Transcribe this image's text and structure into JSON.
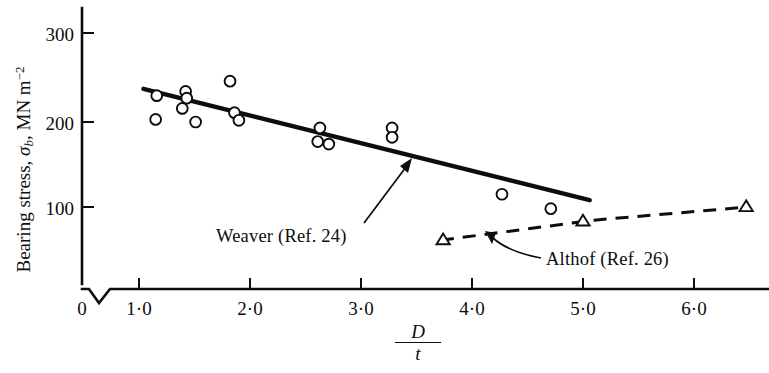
{
  "chart_data": {
    "type": "scatter",
    "title": "",
    "subtitle": "",
    "xlabel": "D/t",
    "xlabel_numerator": "D",
    "xlabel_denominator": "t",
    "ylabel": "Bearing stress, σb, MN m⁻²",
    "ylabel_prefix": "Bearing stress, ",
    "ylabel_symbol": "σ",
    "ylabel_symbol_sub": "b",
    "ylabel_unit": ", MN m",
    "ylabel_unit_sup": "−2",
    "xlim": [
      0.0,
      6.9
    ],
    "ylim": [
      0,
      330
    ],
    "x_axis_break": true,
    "x_axis_break_note": "zigzag break between 0 and 1.0",
    "grid": false,
    "legend": "none",
    "xticks": [
      {
        "value": 0,
        "label": "0"
      },
      {
        "value": 1.0,
        "label": "1·0"
      },
      {
        "value": 2.0,
        "label": "2·0"
      },
      {
        "value": 3.0,
        "label": "3·0"
      },
      {
        "value": 4.0,
        "label": "4·0"
      },
      {
        "value": 5.0,
        "label": "5·0"
      },
      {
        "value": 6.0,
        "label": "6·0"
      }
    ],
    "yticks": [
      {
        "value": 100,
        "label": "100"
      },
      {
        "value": 200,
        "label": "200"
      },
      {
        "value": 300,
        "label": "300"
      }
    ],
    "series": [
      {
        "name": "Weaver (Ref. 24) data",
        "marker": "open-circle",
        "points": [
          {
            "x": 1.16,
            "y": 231
          },
          {
            "x": 1.15,
            "y": 203
          },
          {
            "x": 1.42,
            "y": 236
          },
          {
            "x": 1.43,
            "y": 228
          },
          {
            "x": 1.39,
            "y": 216
          },
          {
            "x": 1.51,
            "y": 200
          },
          {
            "x": 1.82,
            "y": 248
          },
          {
            "x": 1.86,
            "y": 211
          },
          {
            "x": 1.9,
            "y": 202
          },
          {
            "x": 2.63,
            "y": 193
          },
          {
            "x": 2.61,
            "y": 177
          },
          {
            "x": 2.71,
            "y": 174
          },
          {
            "x": 3.28,
            "y": 193
          },
          {
            "x": 3.28,
            "y": 182
          },
          {
            "x": 4.27,
            "y": 115
          },
          {
            "x": 4.71,
            "y": 98
          }
        ]
      },
      {
        "name": "Althof (Ref. 26) data",
        "marker": "open-triangle",
        "points": [
          {
            "x": 3.74,
            "y": 61
          },
          {
            "x": 5.0,
            "y": 83
          },
          {
            "x": 6.47,
            "y": 100
          }
        ]
      }
    ],
    "trend_lines": [
      {
        "name": "Weaver (Ref. 24)",
        "style": "solid",
        "x_start": 1.04,
        "y_start": 239,
        "x_end": 5.06,
        "y_end": 108
      },
      {
        "name": "Althof (Ref. 26)",
        "style": "dashed",
        "x_start": 3.72,
        "y_start": 61,
        "x_end": 6.48,
        "y_end": 100
      }
    ],
    "annotations": [
      {
        "id": "weaver",
        "text": "Weaver  (Ref. 24)",
        "pointer": "arrow pointing up-right to solid trend line"
      },
      {
        "id": "althof",
        "text": "Althof (Ref. 26)",
        "pointer": "curved arrow pointing up-left to dashed trend line"
      }
    ]
  },
  "axis": {
    "y_title_prefix": "Bearing stress, ",
    "y_title_symbol": "σ",
    "y_title_sub": "b",
    "y_title_unit": ", MN m",
    "y_title_sup": "−2",
    "x_title_numerator": "D",
    "x_title_denominator": "t"
  },
  "ticks": {
    "y": [
      "300",
      "200",
      "100"
    ],
    "x": [
      "0",
      "1·0",
      "2·0",
      "3·0",
      "4·0",
      "5·0",
      "6·0"
    ]
  },
  "labels": {
    "weaver": "Weaver  (Ref. 24)",
    "althof": "Althof (Ref. 26)"
  }
}
